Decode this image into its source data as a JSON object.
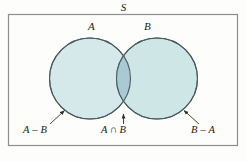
{
  "figure": {
    "type": "venn-diagram",
    "universe_label": "S",
    "set_labels": {
      "left": "A",
      "right": "B"
    },
    "region_labels": {
      "left_only": "A – B",
      "intersection_left": "A",
      "intersection_symbol": "∩",
      "intersection_right": "B",
      "intersection_full": "A ∩ B",
      "right_only": "B – A"
    },
    "colors": {
      "circle_fill": "#d5e8ea",
      "circle_fill_right": "#cfe6e7",
      "intersection_fill": "#a8c9d4",
      "circle_stroke": "#4a5a60",
      "box_stroke": "#8e8e8e",
      "label_color": "#1b1b1b",
      "background": "#fdfdfc",
      "leader_line": "#3a3a3a"
    },
    "geometry": {
      "box": {
        "x": 8,
        "y": 14,
        "width": 230,
        "height": 132
      },
      "circle_left": {
        "cx": 90,
        "cy": 78.5,
        "r": 40.5
      },
      "circle_right": {
        "cx": 157,
        "cy": 78.5,
        "r": 40.5
      }
    }
  }
}
